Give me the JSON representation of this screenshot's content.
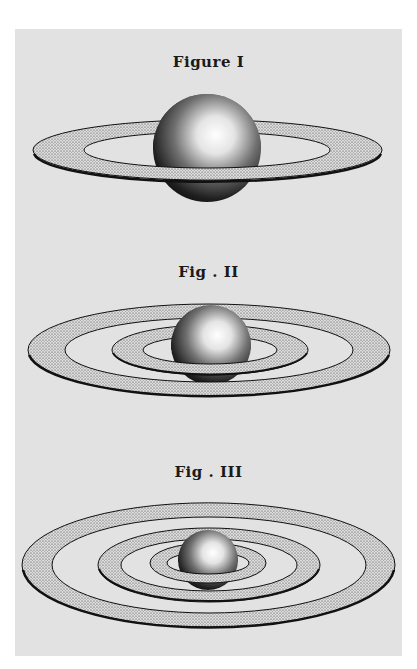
{
  "plate": {
    "background": "#e2e2e2",
    "figures": [
      {
        "label": "Figure I",
        "rings": 1
      },
      {
        "label": "Fig . II",
        "rings": 2
      },
      {
        "label": "Fig . III",
        "rings": 3
      }
    ]
  }
}
